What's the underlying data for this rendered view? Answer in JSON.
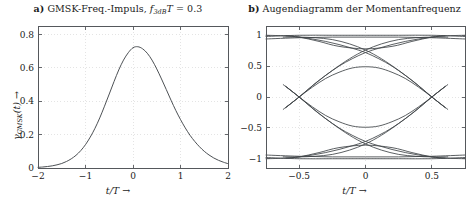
{
  "figure": {
    "background": "#ffffff",
    "curve_color": "#4d5155",
    "frame_color": "#55585c",
    "grid_color": "#d9d9d9"
  },
  "panel_a": {
    "tag": "a)",
    "title_text": "GMSK-Freq.-Impuls,",
    "title_symbol_f": "f",
    "title_symbol_sub": "3dB",
    "title_symbol_T": "T",
    "title_equals": "= 0.3",
    "y_caption_symbol": "γ",
    "y_caption_sub": "GMSK",
    "y_caption_arg": "(t)",
    "y_caption_arrow": "→",
    "x_caption": "t/T →",
    "chart_data": {
      "type": "line",
      "title": "a) GMSK-Freq.-Impuls, f_3dB T = 0.3",
      "xlabel": "t/T →",
      "ylabel": "γ_GMSK(t) →",
      "xlim": [
        -2,
        2
      ],
      "ylim": [
        0,
        0.85
      ],
      "xticks": [
        -2,
        -1,
        0,
        1,
        2
      ],
      "xticklabels": [
        "−2",
        "−1",
        "0",
        "1",
        "2"
      ],
      "yticks": [
        0,
        0.2,
        0.4,
        0.6,
        0.8
      ],
      "yticklabels": [
        "0",
        "0.2",
        "0.4",
        "0.6",
        "0.8"
      ],
      "grid": true,
      "legend": null,
      "peak_value": 0.75,
      "peak_x": 0,
      "series": [
        {
          "name": "gamma_GMSK",
          "x": [
            -2,
            -1.9,
            -1.8,
            -1.7,
            -1.6,
            -1.5,
            -1.4,
            -1.3,
            -1.2,
            -1.1,
            -1,
            -0.9,
            -0.8,
            -0.7,
            -0.6,
            -0.5,
            -0.4,
            -0.3,
            -0.2,
            -0.1,
            0,
            0.1,
            0.2,
            0.3,
            0.4,
            0.5,
            0.6,
            0.7,
            0.8,
            0.9,
            1,
            1.1,
            1.2,
            1.3,
            1.4,
            1.5,
            1.6,
            1.7,
            1.8,
            1.9,
            2
          ],
          "y": [
            0.004,
            0.006,
            0.009,
            0.013,
            0.019,
            0.027,
            0.039,
            0.055,
            0.076,
            0.104,
            0.14,
            0.185,
            0.238,
            0.3,
            0.37,
            0.443,
            0.517,
            0.587,
            0.646,
            0.69,
            0.72,
            0.726,
            0.714,
            0.687,
            0.646,
            0.593,
            0.533,
            0.47,
            0.406,
            0.345,
            0.29,
            0.24,
            0.196,
            0.159,
            0.127,
            0.1,
            0.078,
            0.06,
            0.046,
            0.035,
            0.026
          ]
        }
      ]
    }
  },
  "panel_b": {
    "tag": "b)",
    "title_text": "Augendiagramm der Momentanfrequenz",
    "x_caption": "t/T →",
    "chart_data": {
      "type": "line",
      "title": "b) Augendiagramm der Momentanfrequenz",
      "xlabel": "t/T →",
      "ylabel": "",
      "xlim": [
        -0.75,
        0.75
      ],
      "ylim": [
        -1.15,
        1.15
      ],
      "xticks": [
        -0.5,
        0,
        0.5
      ],
      "xticklabels": [
        "−0.5",
        "0",
        "0.5"
      ],
      "yticks": [
        -1,
        -0.5,
        0,
        0.5,
        1
      ],
      "yticklabels": [
        "−1",
        "−0.5",
        "0",
        "0.5",
        "1"
      ],
      "grid": true,
      "legend": null,
      "description": "Eye diagram of instantaneous frequency; crossings at t/T = ±0.5, inner eye opening ±0.5 at t/T = 0, rails near ±1",
      "crossing_points": [
        -0.5,
        0.5
      ],
      "eye_opening": 0.5,
      "rail_levels": [
        -1,
        1
      ],
      "traces": [
        {
          "name": "rail-high-flat",
          "x": [
            -0.75,
            -0.5,
            -0.25,
            0,
            0.25,
            0.5,
            0.75
          ],
          "y": [
            0.98,
            1.0,
            1.0,
            1.0,
            1.0,
            1.0,
            0.98
          ]
        },
        {
          "name": "rail-high-flat2",
          "x": [
            -0.75,
            -0.5,
            -0.25,
            0,
            0.25,
            0.5,
            0.75
          ],
          "y": [
            0.94,
            0.96,
            0.97,
            0.97,
            0.97,
            0.96,
            0.94
          ]
        },
        {
          "name": "rail-low-flat",
          "x": [
            -0.75,
            -0.5,
            -0.25,
            0,
            0.25,
            0.5,
            0.75
          ],
          "y": [
            -0.98,
            -1.0,
            -1.0,
            -1.0,
            -1.0,
            -1.0,
            -0.98
          ]
        },
        {
          "name": "rail-low-flat2",
          "x": [
            -0.75,
            -0.5,
            -0.25,
            0,
            0.25,
            0.5,
            0.75
          ],
          "y": [
            -0.94,
            -0.96,
            -0.97,
            -0.97,
            -0.97,
            -0.96,
            -0.94
          ]
        },
        {
          "name": "high-dip-upper",
          "x": [
            -0.75,
            -0.6,
            -0.5,
            -0.35,
            -0.2,
            0,
            0.2,
            0.35,
            0.5,
            0.6,
            0.75
          ],
          "y": [
            1.0,
            0.99,
            0.97,
            0.9,
            0.82,
            0.78,
            0.82,
            0.9,
            0.97,
            0.99,
            1.0
          ]
        },
        {
          "name": "low-dip-lower",
          "x": [
            -0.75,
            -0.6,
            -0.5,
            -0.35,
            -0.2,
            0,
            0.2,
            0.35,
            0.5,
            0.6,
            0.75
          ],
          "y": [
            -1.0,
            -0.99,
            -0.97,
            -0.9,
            -0.82,
            -0.78,
            -0.82,
            -0.9,
            -0.97,
            -0.99,
            -1.0
          ]
        },
        {
          "name": "rise-cross-a",
          "x": [
            -0.6,
            -0.5,
            -0.4,
            -0.3,
            -0.2,
            -0.1,
            0,
            0.1,
            0.2,
            0.3,
            0.4,
            0.5,
            0.6
          ],
          "y": [
            -0.17,
            0.0,
            0.18,
            0.35,
            0.5,
            0.62,
            0.72,
            0.79,
            0.85,
            0.9,
            0.94,
            0.97,
            0.99
          ]
        },
        {
          "name": "fall-cross-a",
          "x": [
            -0.6,
            -0.5,
            -0.4,
            -0.3,
            -0.2,
            -0.1,
            0,
            0.1,
            0.2,
            0.3,
            0.4,
            0.5,
            0.6
          ],
          "y": [
            0.17,
            0.0,
            -0.18,
            -0.35,
            -0.5,
            -0.62,
            -0.72,
            -0.79,
            -0.85,
            -0.9,
            -0.94,
            -0.97,
            -0.99
          ]
        },
        {
          "name": "rise-cross-b",
          "x": [
            -0.6,
            -0.5,
            -0.4,
            -0.3,
            -0.2,
            -0.1,
            0,
            0.1,
            0.2,
            0.3,
            0.4,
            0.5,
            0.6
          ],
          "y": [
            -0.99,
            -0.97,
            -0.94,
            -0.9,
            -0.85,
            -0.79,
            -0.72,
            -0.62,
            -0.5,
            -0.35,
            -0.18,
            0.0,
            0.17
          ]
        },
        {
          "name": "fall-cross-b",
          "x": [
            -0.6,
            -0.5,
            -0.4,
            -0.3,
            -0.2,
            -0.1,
            0,
            0.1,
            0.2,
            0.3,
            0.4,
            0.5,
            0.6
          ],
          "y": [
            0.99,
            0.97,
            0.94,
            0.9,
            0.85,
            0.79,
            0.72,
            0.62,
            0.5,
            0.35,
            0.18,
            0.0,
            -0.17
          ]
        },
        {
          "name": "inner-eye-upper",
          "x": [
            -0.6,
            -0.5,
            -0.4,
            -0.3,
            -0.2,
            -0.1,
            0,
            0.1,
            0.2,
            0.3,
            0.4,
            0.5,
            0.6
          ],
          "y": [
            -0.17,
            0.0,
            0.16,
            0.3,
            0.4,
            0.47,
            0.49,
            0.47,
            0.4,
            0.3,
            0.16,
            0.0,
            -0.17
          ]
        },
        {
          "name": "inner-eye-lower",
          "x": [
            -0.6,
            -0.5,
            -0.4,
            -0.3,
            -0.2,
            -0.1,
            0,
            0.1,
            0.2,
            0.3,
            0.4,
            0.5,
            0.6
          ],
          "y": [
            0.17,
            0.0,
            -0.16,
            -0.3,
            -0.4,
            -0.47,
            -0.49,
            -0.47,
            -0.4,
            -0.3,
            -0.16,
            0.0,
            0.17
          ]
        },
        {
          "name": "rise-steep-a",
          "x": [
            -0.62,
            -0.5,
            -0.38,
            -0.25,
            -0.12,
            0,
            0.12,
            0.25,
            0.38,
            0.5,
            0.62
          ],
          "y": [
            -0.2,
            0.0,
            0.22,
            0.43,
            0.62,
            0.76,
            0.86,
            0.93,
            0.96,
            0.97,
            0.97
          ]
        },
        {
          "name": "fall-steep-a",
          "x": [
            -0.62,
            -0.5,
            -0.38,
            -0.25,
            -0.12,
            0,
            0.12,
            0.25,
            0.38,
            0.5,
            0.62
          ],
          "y": [
            0.2,
            0.0,
            -0.22,
            -0.43,
            -0.62,
            -0.76,
            -0.86,
            -0.93,
            -0.96,
            -0.97,
            -0.97
          ]
        },
        {
          "name": "rise-steep-b",
          "x": [
            -0.62,
            -0.5,
            -0.38,
            -0.25,
            -0.12,
            0,
            0.12,
            0.25,
            0.38,
            0.5,
            0.62
          ],
          "y": [
            0.97,
            0.97,
            0.96,
            0.93,
            0.86,
            0.76,
            0.62,
            0.43,
            0.22,
            0.0,
            -0.2
          ]
        },
        {
          "name": "fall-steep-b",
          "x": [
            -0.62,
            -0.5,
            -0.38,
            -0.25,
            -0.12,
            0,
            0.12,
            0.25,
            0.38,
            0.5,
            0.62
          ],
          "y": [
            -0.97,
            -0.97,
            -0.96,
            -0.93,
            -0.86,
            -0.76,
            -0.62,
            -0.43,
            -0.22,
            0.0,
            0.2
          ]
        }
      ]
    }
  }
}
